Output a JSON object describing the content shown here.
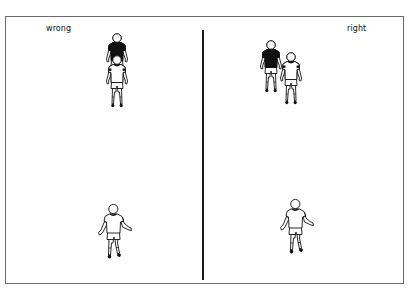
{
  "panels": {
    "left": {
      "label": "wrong",
      "players": [
        {
          "role": "defender",
          "kit": "dark",
          "position": "behind attacker, directly in line"
        },
        {
          "role": "attacker",
          "kit": "light",
          "position": "in front of defender"
        },
        {
          "role": "passer",
          "kit": "light",
          "position": "bottom"
        }
      ]
    },
    "right": {
      "label": "right",
      "players": [
        {
          "role": "defender",
          "kit": "dark",
          "position": "goal-side, offset to the side"
        },
        {
          "role": "attacker",
          "kit": "light",
          "position": "beside defender"
        },
        {
          "role": "passer",
          "kit": "light",
          "position": "bottom"
        }
      ]
    }
  },
  "colors": {
    "border": "#6a6a6a",
    "divider": "#1a1a1a",
    "dark_kit": "#111111",
    "light_kit": "#ffffff",
    "outline": "#111111"
  }
}
